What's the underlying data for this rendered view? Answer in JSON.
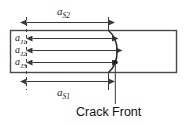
{
  "figure": {
    "name": "crack-front-dimension-diagram",
    "colors": {
      "line": "#3a3a3a",
      "plate_edge": "#4a4a4a",
      "text": "#1a1a1a",
      "background": "#ffffff"
    }
  },
  "dimensions": {
    "top": {
      "symbol": "a",
      "subscript": "S2",
      "label": "aS2"
    },
    "bottom": {
      "symbol": "a",
      "subscript": "S1",
      "label": "aS1"
    }
  },
  "rows": [
    {
      "symbol": "a",
      "subscript": "J1",
      "label": "aJ1"
    },
    {
      "symbol": "a",
      "subscript": "J2",
      "label": "aJ2"
    },
    {
      "symbol": "a",
      "subscript": "J3",
      "label": "aJ3"
    }
  ],
  "annotations": {
    "crack_front": "Crack Front"
  }
}
